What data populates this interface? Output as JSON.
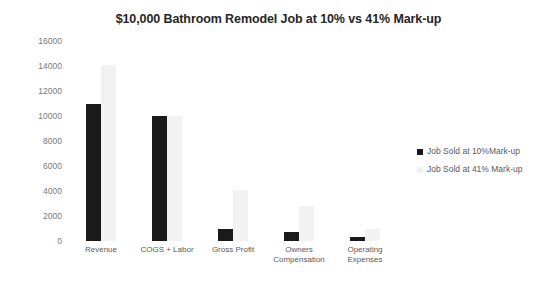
{
  "chart_data": {
    "type": "bar",
    "title": "$10,000 Bathroom Remodel Job at 10% vs 41% Mark-up",
    "xlabel": "",
    "ylabel": "",
    "ylim": [
      0,
      16000
    ],
    "ytick_step": 2000,
    "yticks": [
      "16000",
      "14000",
      "12000",
      "10000",
      "8000",
      "6000",
      "4000",
      "2000",
      "0"
    ],
    "grid": false,
    "legend_position": "right",
    "categories": [
      "Revenue",
      "COGS + Labor",
      "Gross Profit",
      "Owners Compensation",
      "Operating Expenses"
    ],
    "series": [
      {
        "name": "Job Sold at 10%Mark-up",
        "color": "#1a1a1a",
        "values": [
          11000,
          10000,
          1000,
          700,
          300
        ]
      },
      {
        "name": "Job Sold at 41% Mark-up",
        "color": "#f2f2f2",
        "values": [
          14100,
          10000,
          4100,
          2800,
          1000
        ]
      }
    ]
  }
}
